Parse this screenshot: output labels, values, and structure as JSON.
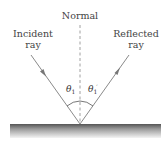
{
  "diagram": {
    "normal_label": "Normal",
    "incident_label_line1": "Incident",
    "incident_label_line2": "ray",
    "reflected_label_line1": "Reflected",
    "reflected_label_line2": "ray",
    "incident_angle_symbol": "θ",
    "incident_angle_subscript": "1",
    "reflected_angle_symbol": "θ",
    "reflected_angle_subscript": "1",
    "reflected_angle_prime": "′",
    "colors": {
      "ray": "#8a8a8a",
      "normal": "#888888",
      "surface_top": "#5a5a5a",
      "surface_bottom": "#f2f2f2",
      "text": "#444444"
    }
  }
}
